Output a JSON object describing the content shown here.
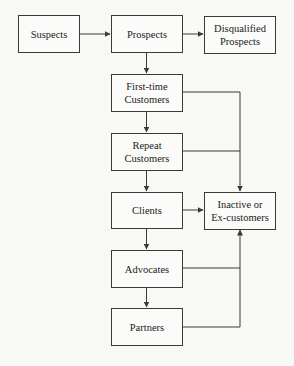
{
  "diagram": {
    "nodes": {
      "suspects": {
        "label": "Suspects"
      },
      "prospects": {
        "label": "Prospects"
      },
      "disqualified": {
        "label": "Disqualified\nProspects"
      },
      "first_time": {
        "label": "First-time\nCustomers"
      },
      "repeat": {
        "label": "Repeat\nCustomers"
      },
      "clients": {
        "label": "Clients"
      },
      "inactive": {
        "label": "Inactive or\nEx-customers"
      },
      "advocates": {
        "label": "Advocates"
      },
      "partners": {
        "label": "Partners"
      }
    },
    "edges": [
      {
        "from": "Suspects",
        "to": "Prospects"
      },
      {
        "from": "Prospects",
        "to": "Disqualified Prospects"
      },
      {
        "from": "Prospects",
        "to": "First-time Customers"
      },
      {
        "from": "First-time Customers",
        "to": "Repeat Customers"
      },
      {
        "from": "Repeat Customers",
        "to": "Clients"
      },
      {
        "from": "Clients",
        "to": "Advocates"
      },
      {
        "from": "Advocates",
        "to": "Partners"
      },
      {
        "from": "First-time Customers",
        "to": "Inactive or Ex-customers"
      },
      {
        "from": "Repeat Customers",
        "to": "Inactive or Ex-customers"
      },
      {
        "from": "Clients",
        "to": "Inactive or Ex-customers"
      },
      {
        "from": "Advocates",
        "to": "Inactive or Ex-customers"
      },
      {
        "from": "Partners",
        "to": "Inactive or Ex-customers"
      }
    ],
    "colors": {
      "line": "#3a3a3a",
      "background": "#f8f8f5"
    }
  }
}
